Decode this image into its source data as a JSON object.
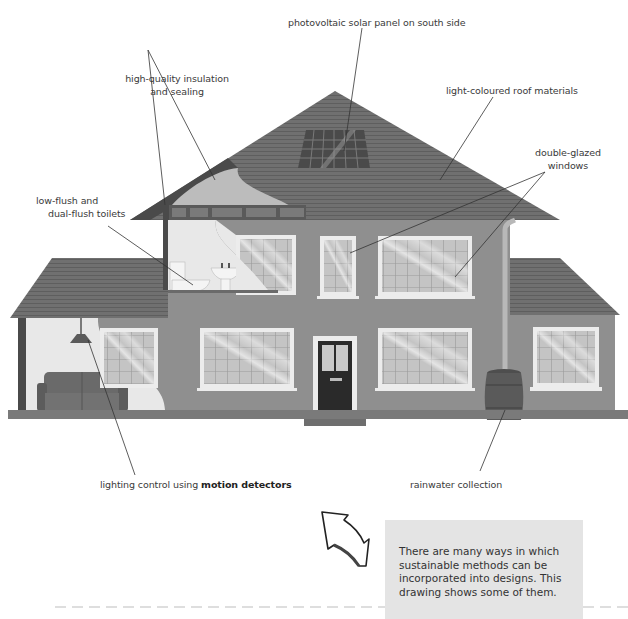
{
  "diagram": {
    "type": "annotated-illustration",
    "labels": {
      "solar": "photovoltaic solar panel on south side",
      "insulation_line1": "high-quality insulation",
      "insulation_line2": "and sealing",
      "roof": "light-coloured roof materials",
      "windows_line1": "double-glazed",
      "windows_line2": "windows",
      "toilets_line1": "low-flush and",
      "toilets_line2": "dual-flush toilets",
      "lighting_prefix": "lighting control using ",
      "lighting_bold": "motion detectors",
      "rainwater": "rainwater collection"
    },
    "note": "There are many ways in which sustainable methods can be incorporated into designs. This drawing shows some of them.",
    "colors": {
      "roof": "#6e6e6e",
      "roof_line": "#5c5c5c",
      "wall": "#8f8f8f",
      "interior": "#e6e6e6",
      "window_frame": "#ececec",
      "window_glass": "#bdbdbd",
      "door": "#2a2a2a",
      "base": "#7a7a7a",
      "note_bg": "#e4e4e4",
      "leader_line": "#333333"
    }
  }
}
